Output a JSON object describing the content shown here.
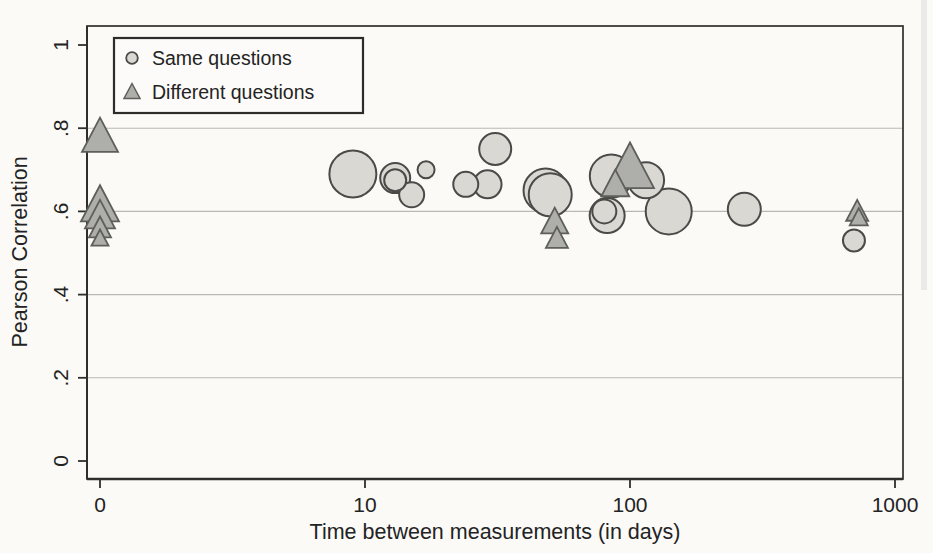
{
  "colors": {
    "background": "#fbfaf7",
    "frame": "#2e2e2c",
    "grid": "#b9b9b4",
    "text": "#232323",
    "circle_fill": "#d9d8d3",
    "circle_stroke": "#4a4a48",
    "triangle_fill": "#aeaeaa",
    "triangle_stroke": "#5e5e5a",
    "legend_border": "#2c2c2a",
    "legend_fill": "#fcfbf9"
  },
  "legend": {
    "items": [
      {
        "label": "Same questions",
        "marker": "circle"
      },
      {
        "label": "Different questions",
        "marker": "triangle"
      }
    ]
  },
  "chart_data": {
    "type": "scatter",
    "title": "",
    "xlabel": "Time between measurements (in days)",
    "ylabel": "Pearson Correlation",
    "x_scale": "log10 (0 plotted at axis origin)",
    "x_ticks": [
      {
        "value": 0,
        "label": "0"
      },
      {
        "value": 10,
        "label": "10"
      },
      {
        "value": 100,
        "label": "100"
      },
      {
        "value": 1000,
        "label": "1000"
      }
    ],
    "y_ticks": [
      {
        "value": 0,
        "label": "0"
      },
      {
        "value": 0.2,
        "label": ".2"
      },
      {
        "value": 0.4,
        "label": ".4"
      },
      {
        "value": 0.6,
        "label": ".6"
      },
      {
        "value": 0.8,
        "label": ".8"
      },
      {
        "value": 1,
        "label": "1"
      }
    ],
    "y_gridlines": [
      0.2,
      0.4,
      0.6,
      0.8
    ],
    "ylim": [
      0,
      1
    ],
    "legend_position": "top-left inside plot",
    "bubble_note": "marker size = study weight (pixel radius / half-width)",
    "series": [
      {
        "name": "Same questions",
        "marker": "circle",
        "points": [
          {
            "days": 9,
            "corr": 0.69,
            "size": 23.5
          },
          {
            "days": 13,
            "corr": 0.68,
            "size": 15
          },
          {
            "days": 13,
            "corr": 0.675,
            "size": 11
          },
          {
            "days": 17,
            "corr": 0.7,
            "size": 8.5
          },
          {
            "days": 15,
            "corr": 0.64,
            "size": 12.5
          },
          {
            "days": 24,
            "corr": 0.665,
            "size": 12.5
          },
          {
            "days": 29,
            "corr": 0.665,
            "size": 14
          },
          {
            "days": 31,
            "corr": 0.75,
            "size": 16
          },
          {
            "days": 48,
            "corr": 0.65,
            "size": 22
          },
          {
            "days": 50,
            "corr": 0.64,
            "size": 21.5
          },
          {
            "days": 85,
            "corr": 0.685,
            "size": 21.5
          },
          {
            "days": 115,
            "corr": 0.675,
            "size": 18
          },
          {
            "days": 80,
            "corr": 0.6,
            "size": 12
          },
          {
            "days": 82,
            "corr": 0.59,
            "size": 17.5
          },
          {
            "days": 140,
            "corr": 0.6,
            "size": 23
          },
          {
            "days": 270,
            "corr": 0.605,
            "size": 16.5
          },
          {
            "days": 700,
            "corr": 0.53,
            "size": 11
          }
        ]
      },
      {
        "name": "Different questions",
        "marker": "triangle",
        "points": [
          {
            "days": 0,
            "corr": 0.78,
            "size": 18
          },
          {
            "days": 0,
            "corr": 0.615,
            "size": 19
          },
          {
            "days": 0,
            "corr": 0.59,
            "size": 15
          },
          {
            "days": 0,
            "corr": 0.56,
            "size": 11
          },
          {
            "days": 0,
            "corr": 0.535,
            "size": 8.5
          },
          {
            "days": 52,
            "corr": 0.575,
            "size": 13.5
          },
          {
            "days": 53,
            "corr": 0.535,
            "size": 11
          },
          {
            "days": 100,
            "corr": 0.705,
            "size": 24
          },
          {
            "days": 88,
            "corr": 0.665,
            "size": 14
          },
          {
            "days": 720,
            "corr": 0.6,
            "size": 11
          },
          {
            "days": 730,
            "corr": 0.585,
            "size": 9
          }
        ]
      }
    ]
  }
}
